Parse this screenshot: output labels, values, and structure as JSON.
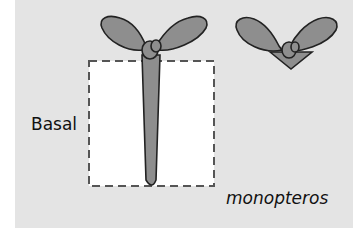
{
  "labels": {
    "basal": "Basal",
    "genotype": "monopteros"
  },
  "colors": {
    "panel_bg": "#e4e4e4",
    "seedling_fill": "#8e8e8e",
    "outline": "#222222",
    "box_fill": "#ffffff"
  },
  "figure": {
    "seedlings": [
      {
        "name": "seedling-with-root",
        "has_hypocotyl_root": true
      },
      {
        "name": "seedling-without-root",
        "has_hypocotyl_root": false
      }
    ],
    "dashed_box": {
      "region": "basal"
    }
  }
}
